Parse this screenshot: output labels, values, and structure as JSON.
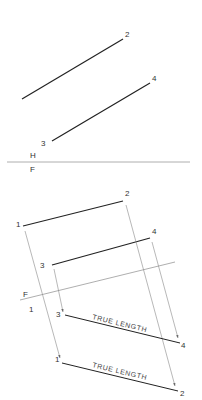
{
  "top_view": {
    "plane_labels": {
      "upper": "H",
      "lower": "F"
    },
    "points": {
      "p2": "2",
      "p3": "3",
      "p4": "4"
    }
  },
  "front_view": {
    "points": {
      "p1": "1",
      "p2": "2",
      "p3": "3",
      "p4": "4"
    },
    "fold_labels": {
      "upper": "F",
      "lower": "1"
    }
  },
  "auxiliary_view": {
    "points": {
      "p1": "1",
      "p2": "2",
      "p3": "3",
      "p4": "4"
    },
    "line_3_4_label": "TRUE LENGTH",
    "line_1_2_label": "TRUE LENGTH"
  },
  "colors": {
    "line": "#222222",
    "projector": "#888888",
    "fold": "#999999"
  }
}
